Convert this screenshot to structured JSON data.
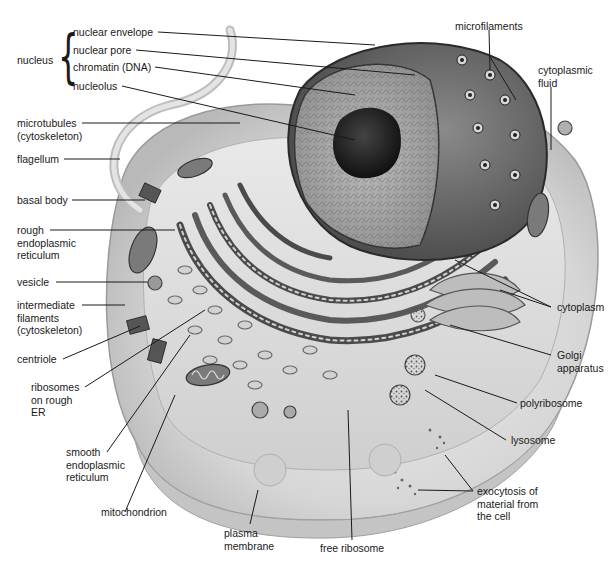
{
  "diagram": {
    "style": "grayscale illustration",
    "colors": {
      "background": "#ffffff",
      "leader_line": "#1a1a1a",
      "label_text": "#1a1a1a",
      "membrane_light": "#e6e6e6",
      "membrane_mid": "#c8c8c8",
      "cytoplasm": "#d9d9d9",
      "nucleus_dark": "#5a5a5a",
      "nucleolus": "#2a2a2a",
      "er_dark": "#4a4a4a"
    },
    "group_labels": {
      "nucleus": "nucleus"
    },
    "labels": {
      "nuclear_envelope": "nuclear envelope",
      "nuclear_pore": "nuclear pore",
      "chromatin": "chromatin (DNA)",
      "nucleolus": "nucleolus",
      "microtubules": "microtubules\n(cytoskeleton)",
      "flagellum": "flagellum",
      "basal_body": "basal body",
      "rough_er": "rough\nendoplasmic\nreticulum",
      "vesicle": "vesicle",
      "intermediate_filaments": "intermediate\nfilaments\n(cytoskeleton)",
      "centriole": "centriole",
      "ribosomes_on_rough_er": "ribosomes\non rough\nER",
      "smooth_er": "smooth\nendoplasmic\nreticulum",
      "mitochondrion": "mitochondrion",
      "plasma_membrane": "plasma\nmembrane",
      "free_ribosome": "free ribosome",
      "microfilaments": "microfilaments",
      "cytoplasmic_fluid": "cytoplasmic\nfluid",
      "cytoplasm": "cytoplasm",
      "golgi_apparatus": "Golgi\napparatus",
      "polyribosome": "polyribosome",
      "lysosome": "lysosome",
      "exocytosis": "exocytosis of\nmaterial from\nthe cell"
    }
  }
}
